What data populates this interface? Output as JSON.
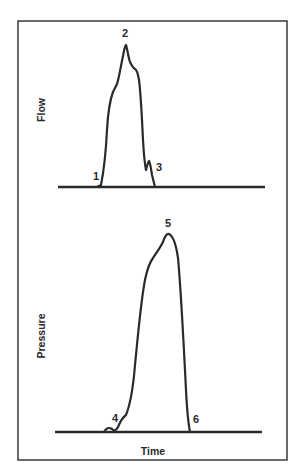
{
  "figure": {
    "panels": [
      {
        "id": "flow",
        "ylabel": "Flow",
        "points": [
          {
            "label": "1",
            "description": "start of flow"
          },
          {
            "label": "2",
            "description": "peak flow"
          },
          {
            "label": "3",
            "description": "end of flow"
          }
        ]
      },
      {
        "id": "pressure",
        "ylabel": "Pressure",
        "xlabel": "Time",
        "points": [
          {
            "label": "4",
            "description": "start of pressure rise"
          },
          {
            "label": "5",
            "description": "peak pressure"
          },
          {
            "label": "6",
            "description": "end of pressure"
          }
        ]
      }
    ],
    "colors": {
      "line": "#2a2a2a",
      "frame": "#3a3a3a",
      "background": "#ffffff"
    }
  }
}
